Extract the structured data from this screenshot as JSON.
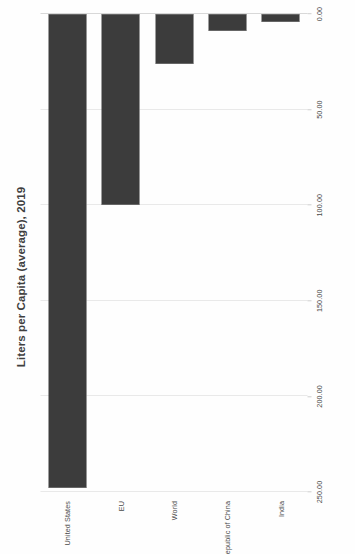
{
  "chart_data": {
    "type": "bar",
    "orientation": "horizontal",
    "title": "Liters per Capita (average), 2019",
    "xlabel": "",
    "ylabel": "",
    "categories": [
      "United States",
      "EU",
      "World",
      "People's Republic of China",
      "India"
    ],
    "values": [
      248.0,
      100.0,
      26.0,
      9.0,
      4.0
    ],
    "series": [
      {
        "name": "Liters per Capita",
        "values": [
          248.0,
          100.0,
          26.0,
          9.0,
          4.0
        ]
      }
    ],
    "xlim": [
      0,
      250
    ],
    "x_reversed": true,
    "xticks": [
      250,
      200,
      150,
      100,
      50,
      0
    ],
    "xticklabels": [
      "250.00",
      "200.00",
      "150.00",
      "100.00",
      "50.00",
      "0.00"
    ],
    "grid": "vertical",
    "legend": null,
    "bar_color": "#3c3c3c",
    "gridline_color": "#e9e9e9",
    "background_color": "#ffffff"
  },
  "figure": {
    "page_rotation": "-90deg",
    "title": "Liters per Capita (average), 2019"
  }
}
